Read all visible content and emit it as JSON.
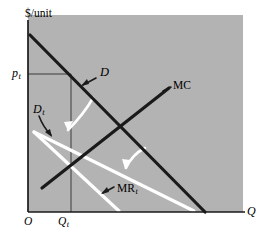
{
  "figure": {
    "kind": "economics-diagram",
    "background_color": "#ffffff",
    "plot_fill_color": "#b3b3b3",
    "axis_color": "#1a1a1a",
    "black_curve_color": "#1a1a1a",
    "white_curve_color": "#ffffff"
  },
  "axes": {
    "y_axis_label": "$/unit",
    "x_axis_label": "Q",
    "origin_label": "O",
    "y_tick_label": "p",
    "y_tick_label_sub": "t",
    "x_tick_label": "Q",
    "x_tick_label_sub": "t"
  },
  "curves": [
    {
      "name": "demand",
      "label": "D",
      "label_sub": "",
      "style": "black-solid",
      "description": "original downward-sloping demand curve"
    },
    {
      "name": "demand-after-tax",
      "label": "D",
      "label_sub": "t",
      "style": "white-solid",
      "description": "shifted, flatter demand curve after tax"
    },
    {
      "name": "marginal-cost",
      "label": "MC",
      "label_sub": "",
      "style": "black-solid",
      "description": "upward-sloping marginal cost curve"
    },
    {
      "name": "marginal-revenue-after-tax",
      "label": "MR",
      "label_sub": "t",
      "style": "white-solid",
      "description": "marginal revenue curve associated with D sub t"
    }
  ],
  "annotations": [
    {
      "name": "d-pointer",
      "target": "demand",
      "style": "black-arrow"
    },
    {
      "name": "dt-pointer",
      "target": "demand-after-tax",
      "style": "black-curved-arrow"
    },
    {
      "name": "mc-pointer",
      "target": "marginal-cost",
      "style": "black-arrow"
    },
    {
      "name": "mrt-pointer",
      "target": "marginal-revenue-after-tax",
      "style": "black-arrow"
    },
    {
      "name": "demand-shift-arrow",
      "style": "white-curved-arrow",
      "description": "curved white arrow showing demand rotating down from D to D sub t"
    },
    {
      "name": "mr-shift-arrow",
      "style": "white-curved-arrow",
      "description": "curved white arrow near MC showing marginal revenue shift"
    }
  ],
  "guides": [
    {
      "name": "price-guide-line",
      "description": "horizontal dashed-free thin line from p sub t to the demand curve"
    },
    {
      "name": "quantity-guide-line",
      "description": "vertical thin line from Q sub t up to the demand curve"
    }
  ]
}
